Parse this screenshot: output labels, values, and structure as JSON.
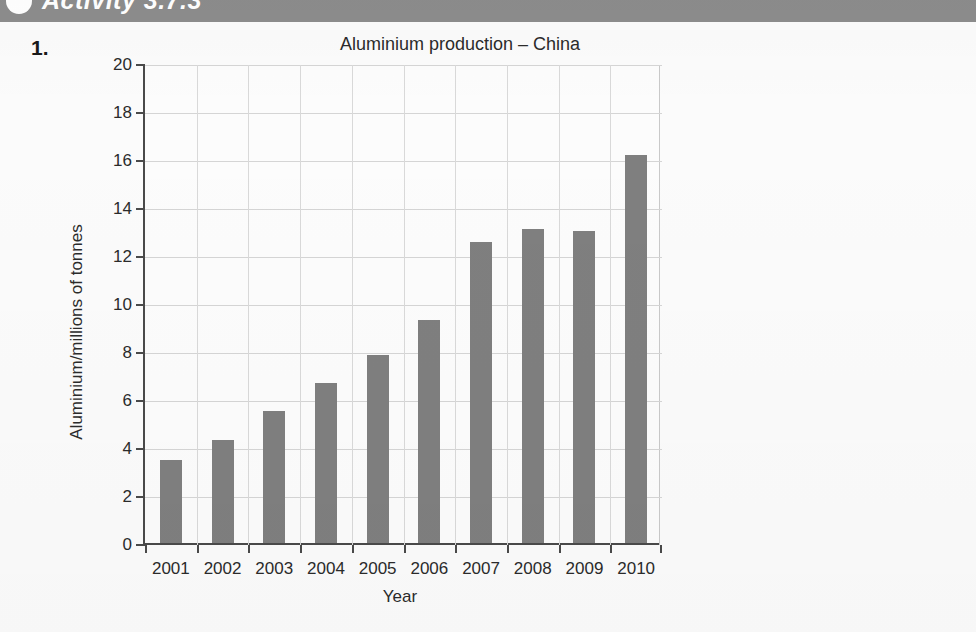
{
  "banner": {
    "title": "Activity 3.7.3",
    "bullet_icon": "circle-bullet-icon",
    "background_color": "#8c8c8c"
  },
  "question": {
    "number": "1."
  },
  "chart_data": {
    "type": "bar",
    "title": "Aluminium production – China",
    "xlabel": "Year",
    "ylabel": "Aluminium/millions of tonnes",
    "categories": [
      "2001",
      "2002",
      "2003",
      "2004",
      "2005",
      "2006",
      "2007",
      "2008",
      "2009",
      "2010"
    ],
    "values": [
      3.45,
      4.3,
      5.5,
      6.65,
      7.85,
      9.3,
      12.55,
      13.1,
      13.0,
      16.15
    ],
    "ylim": [
      0,
      20
    ],
    "ytick_labels": [
      "0",
      "2",
      "4",
      "6",
      "8",
      "10",
      "12",
      "14",
      "16",
      "18",
      "20"
    ],
    "ytick_values": [
      0,
      2,
      4,
      6,
      8,
      10,
      12,
      14,
      16,
      18,
      20
    ],
    "grid": true,
    "legend": false,
    "bar_color": "#7f7f7f",
    "axis_color": "#4a4a4a",
    "grid_color": "#d5d5d5"
  }
}
